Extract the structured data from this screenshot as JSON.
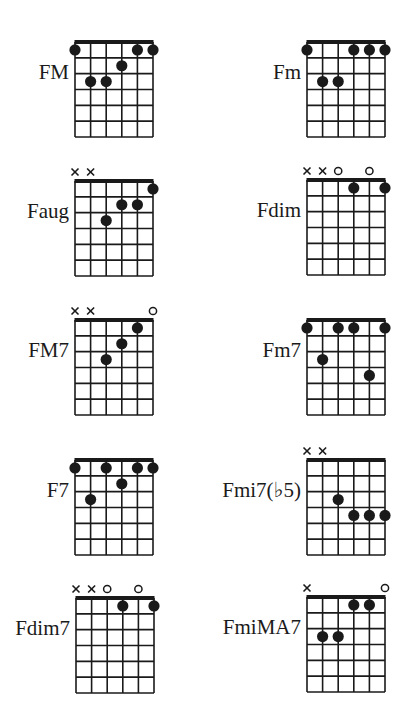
{
  "sheet": {
    "ink_color": "#1a1a1a",
    "background": "#ffffff",
    "strings": 6,
    "frets": 6
  },
  "chords": [
    {
      "name": "FM",
      "markers": [
        "",
        "",
        "",
        "",
        "",
        ""
      ],
      "dots": [
        [
          1,
          1
        ],
        [
          1,
          5
        ],
        [
          1,
          6
        ],
        [
          2,
          4
        ],
        [
          3,
          2
        ],
        [
          3,
          3
        ]
      ]
    },
    {
      "name": "Fm",
      "markers": [
        "",
        "",
        "",
        "",
        "",
        ""
      ],
      "dots": [
        [
          1,
          1
        ],
        [
          1,
          4
        ],
        [
          1,
          5
        ],
        [
          1,
          6
        ],
        [
          3,
          2
        ],
        [
          3,
          3
        ]
      ]
    },
    {
      "name": "Faug",
      "markers": [
        "x",
        "x",
        "",
        "",
        "",
        ""
      ],
      "dots": [
        [
          1,
          6
        ],
        [
          2,
          4
        ],
        [
          2,
          5
        ],
        [
          3,
          3
        ]
      ]
    },
    {
      "name": "Fdim",
      "markers": [
        "x",
        "x",
        "o",
        "",
        "o",
        ""
      ],
      "dots": [
        [
          1,
          4
        ],
        [
          1,
          6
        ]
      ]
    },
    {
      "name": "FM7",
      "markers": [
        "x",
        "x",
        "",
        "",
        "",
        "o"
      ],
      "dots": [
        [
          1,
          5
        ],
        [
          2,
          4
        ],
        [
          3,
          3
        ]
      ]
    },
    {
      "name": "Fm7",
      "markers": [
        "",
        "",
        "",
        "",
        "",
        ""
      ],
      "dots": [
        [
          1,
          1
        ],
        [
          1,
          3
        ],
        [
          1,
          4
        ],
        [
          1,
          6
        ],
        [
          3,
          2
        ],
        [
          4,
          5
        ]
      ]
    },
    {
      "name": "F7",
      "markers": [
        "",
        "",
        "",
        "",
        "",
        ""
      ],
      "dots": [
        [
          1,
          1
        ],
        [
          1,
          3
        ],
        [
          1,
          5
        ],
        [
          1,
          6
        ],
        [
          2,
          4
        ],
        [
          3,
          2
        ]
      ]
    },
    {
      "name": "Fmi7(♭5)",
      "markers": [
        "x",
        "x",
        "",
        "",
        "",
        ""
      ],
      "dots": [
        [
          3,
          3
        ],
        [
          4,
          4
        ],
        [
          4,
          5
        ],
        [
          4,
          6
        ]
      ]
    },
    {
      "name": "Fdim7",
      "markers": [
        "x",
        "x",
        "o",
        "",
        "o",
        ""
      ],
      "dots": [
        [
          1,
          4
        ],
        [
          1,
          6
        ]
      ]
    },
    {
      "name": "FmiMA7",
      "markers": [
        "x",
        "",
        "",
        "",
        "",
        "o"
      ],
      "dots": [
        [
          1,
          4
        ],
        [
          1,
          5
        ],
        [
          3,
          2
        ],
        [
          3,
          3
        ]
      ]
    }
  ]
}
